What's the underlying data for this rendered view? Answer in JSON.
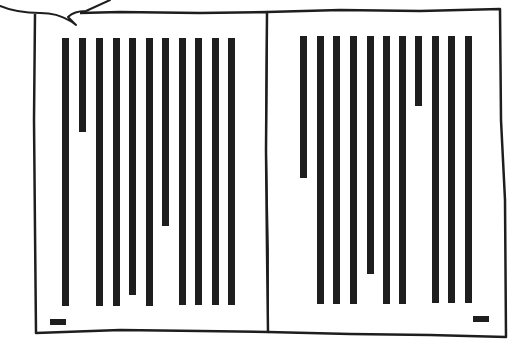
{
  "scene": {
    "description": "Hand-drawn comic panel: open book with columns of text shown as vertical bars, speech bubble tail at top-left",
    "ink_color": "#1e1e1e",
    "paper_color": "#ffffff"
  },
  "speech_bubble": {
    "visible_part": "bottom edge with tail pointing down-left"
  },
  "book": {
    "spine_x": 267,
    "left_page": {
      "bar_width": 7,
      "bar_top": 38,
      "bars": [
        {
          "x": 62,
          "bottom": 306
        },
        {
          "x": 79,
          "bottom": 132
        },
        {
          "x": 96,
          "bottom": 306
        },
        {
          "x": 113,
          "bottom": 306
        },
        {
          "x": 129,
          "bottom": 295
        },
        {
          "x": 146,
          "bottom": 306
        },
        {
          "x": 162,
          "bottom": 226
        },
        {
          "x": 179,
          "bottom": 305
        },
        {
          "x": 195,
          "bottom": 305
        },
        {
          "x": 212,
          "bottom": 305
        },
        {
          "x": 228,
          "bottom": 305
        }
      ],
      "page_number_marker": {
        "x": 50,
        "y": 319,
        "w": 16,
        "h": 6
      }
    },
    "right_page": {
      "bar_width": 7,
      "bar_top": 36,
      "bars": [
        {
          "x": 300,
          "bottom": 178
        },
        {
          "x": 317,
          "bottom": 304
        },
        {
          "x": 333,
          "bottom": 304
        },
        {
          "x": 350,
          "bottom": 304
        },
        {
          "x": 367,
          "bottom": 274
        },
        {
          "x": 383,
          "bottom": 304
        },
        {
          "x": 399,
          "bottom": 304
        },
        {
          "x": 415,
          "bottom": 106
        },
        {
          "x": 432,
          "bottom": 303
        },
        {
          "x": 448,
          "bottom": 303
        },
        {
          "x": 465,
          "bottom": 303
        }
      ],
      "page_number_marker": {
        "x": 473,
        "y": 316,
        "w": 16,
        "h": 6
      }
    }
  }
}
